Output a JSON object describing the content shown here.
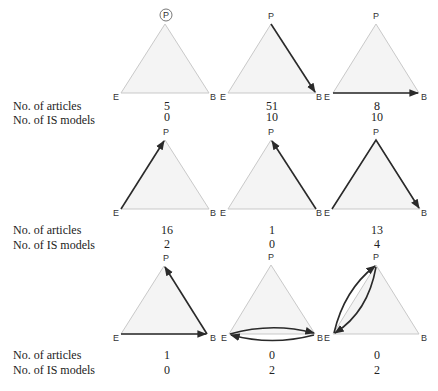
{
  "labels": {
    "articles": "No. of articles",
    "is_models": "No. of IS models"
  },
  "vertex_labels": {
    "top": "P",
    "left": "E",
    "right": "B"
  },
  "panels": [
    {
      "id": "r1c1",
      "path": "none (P circled)",
      "articles": "5",
      "is_models": "0"
    },
    {
      "id": "r1c2",
      "path": "P → B",
      "articles": "51",
      "is_models": "10"
    },
    {
      "id": "r1c3",
      "path": "E → B",
      "articles": "8",
      "is_models": "10"
    },
    {
      "id": "r2c1",
      "path": "E → P",
      "articles": "16",
      "is_models": "2"
    },
    {
      "id": "r2c2",
      "path": "B → P",
      "articles": "1",
      "is_models": "0"
    },
    {
      "id": "r2c3",
      "path": "E → P → B",
      "articles": "13",
      "is_models": "4"
    },
    {
      "id": "r3c1",
      "path": "E → B → P",
      "articles": "1",
      "is_models": "0"
    },
    {
      "id": "r3c2",
      "path": "E ↔ B",
      "articles": "0",
      "is_models": "2"
    },
    {
      "id": "r3c3",
      "path": "E ↔ P",
      "articles": "0",
      "is_models": "2"
    }
  ],
  "colors": {
    "triangle_fill": "#f4f4f4",
    "triangle_edge": "#c9c9c9",
    "arrow": "#2a2a2a"
  }
}
